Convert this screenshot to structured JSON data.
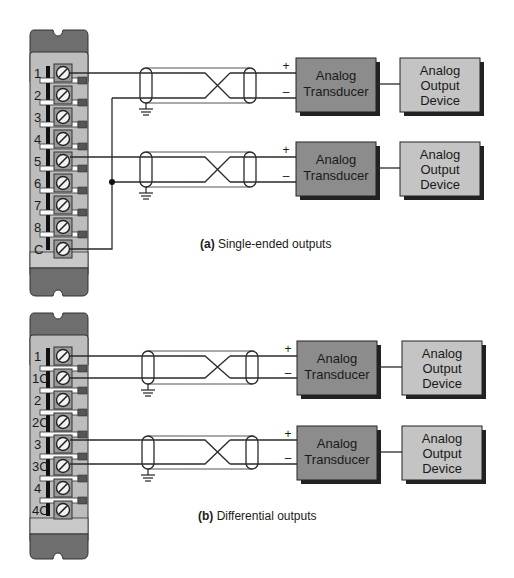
{
  "colors": {
    "block_dark": "#6e6e6e",
    "block_light": "#bdbdbd",
    "transducer_fill": "#8c8c8c",
    "output_fill": "#c4c4c4",
    "screw_fill": "#9a9a9a",
    "wire": "#2a2a2a"
  },
  "diagram_a": {
    "caption_label": "(a)",
    "caption_text": " Single-ended outputs",
    "terminals": [
      "1",
      "2",
      "3",
      "4",
      "5",
      "6",
      "7",
      "8",
      "C"
    ],
    "channels": [
      {
        "plus_sign": "+",
        "minus_sign": "–",
        "transducer_line1": "Analog",
        "transducer_line2": "Transducer",
        "output_line1": "Analog",
        "output_line2": "Output",
        "output_line3": "Device"
      },
      {
        "plus_sign": "+",
        "minus_sign": "–",
        "transducer_line1": "Analog",
        "transducer_line2": "Transducer",
        "output_line1": "Analog",
        "output_line2": "Output",
        "output_line3": "Device"
      }
    ]
  },
  "diagram_b": {
    "caption_label": "(b)",
    "caption_text": " Differential outputs",
    "terminals": [
      "1",
      "1C",
      "2",
      "2C",
      "3",
      "3C",
      "4",
      "4C"
    ],
    "channels": [
      {
        "plus_sign": "+",
        "minus_sign": "–",
        "transducer_line1": "Analog",
        "transducer_line2": "Transducer",
        "output_line1": "Analog",
        "output_line2": "Output",
        "output_line3": "Device"
      },
      {
        "plus_sign": "+",
        "minus_sign": "–",
        "transducer_line1": "Analog",
        "transducer_line2": "Transducer",
        "output_line1": "Analog",
        "output_line2": "Output",
        "output_line3": "Device"
      }
    ]
  }
}
